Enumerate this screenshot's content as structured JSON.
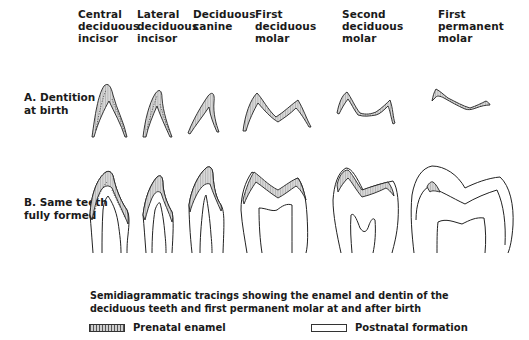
{
  "columns": [
    {
      "label_lines": [
        "Central",
        "deciduous",
        "incisor"
      ]
    },
    {
      "label_lines": [
        "Lateral",
        "deciduous",
        "incisor"
      ]
    },
    {
      "label_lines": [
        "Deciduous",
        "canine"
      ]
    },
    {
      "label_lines": [
        "First",
        "deciduous",
        "molar"
      ]
    },
    {
      "label_lines": [
        "Second",
        "deciduous",
        "molar"
      ]
    },
    {
      "label_lines": [
        "First",
        "permanent",
        "molar"
      ]
    }
  ],
  "rows": [
    {
      "label_lines": [
        "A.  Dentition",
        "at birth"
      ]
    },
    {
      "label_lines": [
        "B.  Same teeth",
        "fully formed"
      ]
    }
  ],
  "caption_lines": [
    "Semidiagrammatic tracings showing the enamel and dentin of the",
    "deciduous teeth and first permanent molar at and after birth"
  ],
  "legend": [
    {
      "key": "prenatal",
      "label": "Prenatal enamel"
    },
    {
      "key": "postnatal",
      "label": "Postnatal formation"
    }
  ]
}
